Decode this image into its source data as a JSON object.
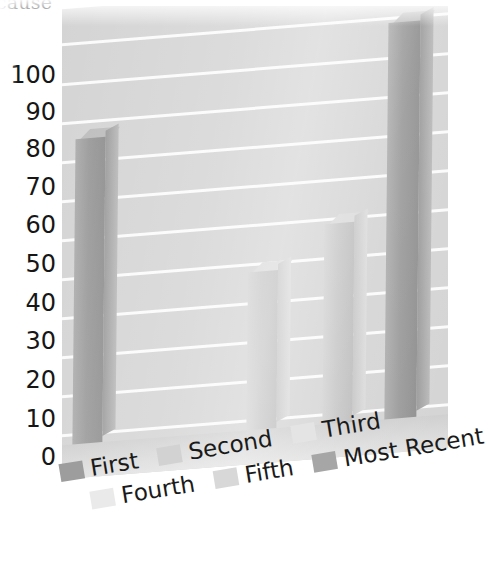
{
  "title_fragment": "cause",
  "chart_data": {
    "type": "bar",
    "title": "cause",
    "xlabel": "",
    "ylabel": "",
    "ylim": [
      0,
      100
    ],
    "yticks": [
      100,
      90,
      80,
      70,
      60,
      50,
      40,
      30,
      20,
      10,
      0
    ],
    "ytick_labels": [
      "100",
      "90",
      "80",
      "70",
      "60",
      "50",
      "40",
      "30",
      "20",
      "10",
      "0"
    ],
    "grid": true,
    "legend_position": "bottom",
    "three_d": true,
    "categories": [
      "First",
      "Second",
      "Third",
      "Fourth",
      "Fifth",
      "Most Recent"
    ],
    "values": [
      80,
      41,
      52,
      null,
      null,
      104
    ],
    "series": [
      {
        "name": "First",
        "value": 80,
        "color": "#9a9a9a"
      },
      {
        "name": "Second",
        "value": 41,
        "color": "#c6c6c6"
      },
      {
        "name": "Third",
        "value": 52,
        "color": "#c6c6c6"
      },
      {
        "name": "Fourth",
        "value": null,
        "color": "#e0e0e0"
      },
      {
        "name": "Fifth",
        "value": null,
        "color": "#d8d8d8"
      },
      {
        "name": "Most Recent",
        "value": 104,
        "color": "#9a9a9a"
      }
    ]
  },
  "axis": {
    "y_ticks": [
      {
        "label": "100",
        "top": 63
      },
      {
        "label": "90",
        "top": 100
      },
      {
        "label": "80",
        "top": 137
      },
      {
        "label": "70",
        "top": 175
      },
      {
        "label": "60",
        "top": 213
      },
      {
        "label": "50",
        "top": 252
      },
      {
        "label": "40",
        "top": 291
      },
      {
        "label": "30",
        "top": 329
      },
      {
        "label": "20",
        "top": 368
      },
      {
        "label": "10",
        "top": 407
      },
      {
        "label": "0",
        "top": 445
      }
    ]
  },
  "bars": [
    {
      "name": "bar-first",
      "series": "First",
      "value": 80,
      "left": 18,
      "width": 30,
      "height": 305,
      "shade": "dark"
    },
    {
      "name": "bar-second",
      "series": "Second",
      "value": 41,
      "left": 192,
      "width": 30,
      "height": 158,
      "shade": "light"
    },
    {
      "name": "bar-third",
      "series": "Third",
      "value": 52,
      "left": 268,
      "width": 30,
      "height": 200,
      "shade": "light"
    },
    {
      "name": "bar-most-recent",
      "series": "Most Recent",
      "value": 104,
      "left": 330,
      "width": 32,
      "height": 396,
      "shade": "dark"
    }
  ],
  "gridlines": [
    {
      "top": 34
    },
    {
      "top": 74
    },
    {
      "top": 113
    },
    {
      "top": 152
    },
    {
      "top": 191
    },
    {
      "top": 230
    },
    {
      "top": 269
    },
    {
      "top": 308
    },
    {
      "top": 347
    },
    {
      "top": 386
    },
    {
      "top": 425
    }
  ],
  "legend": {
    "row1": [
      {
        "label": "First",
        "color": "#9d9d9d"
      },
      {
        "label": "Second",
        "color": "#d2d2d2"
      },
      {
        "label": "Third",
        "color": "#e4e4e4"
      }
    ],
    "row2": [
      {
        "label": "Fourth",
        "color": "#eaeaea"
      },
      {
        "label": "Fifth",
        "color": "#d8d8d8"
      },
      {
        "label": "Most Recent",
        "color": "#a6a6a6"
      }
    ]
  }
}
